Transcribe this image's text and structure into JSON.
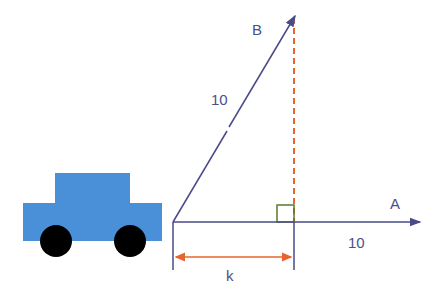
{
  "diagram": {
    "labels": {
      "vector_b": "B",
      "vector_a": "A",
      "magnitude_b": "10",
      "magnitude_a": "10",
      "projection": "k"
    },
    "colors": {
      "vector": "#4a4a8a",
      "projection_line": "#e8642a",
      "right_angle": "#5a7a2a",
      "car_body": "#4a90d9",
      "wheel": "#000000",
      "label": "#4a4f8a"
    },
    "elements": {
      "car": "car-shape",
      "right_angle_marker": "square",
      "dimension_arrow": "double-headed arrow"
    }
  }
}
